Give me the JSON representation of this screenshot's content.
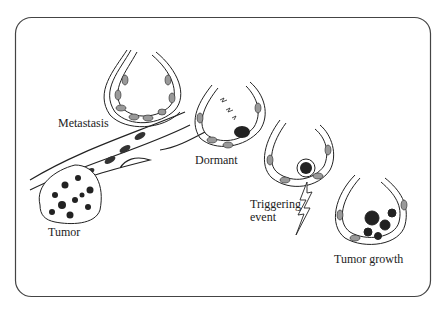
{
  "diagram": {
    "frame": {
      "stroke": "#444444",
      "radius": 16
    },
    "labels": {
      "metastasis": "Metastasis",
      "tumor": "Tumor",
      "dormant": "Dormant",
      "triggering_line1": "Triggering",
      "triggering_line2": "event",
      "tumor_growth": "Tumor growth"
    },
    "stages": [
      "Tumor",
      "Metastasis",
      "Dormant",
      "Triggering event",
      "Tumor growth"
    ]
  }
}
